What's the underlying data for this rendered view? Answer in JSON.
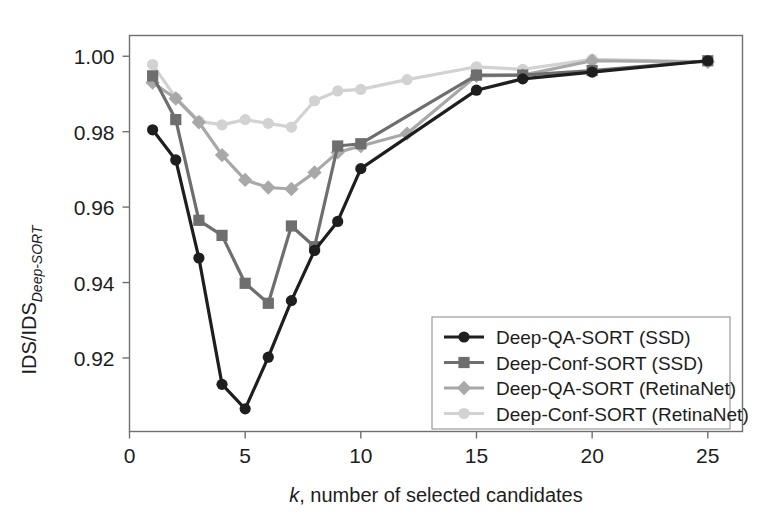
{
  "figure": {
    "background_color": "#ffffff",
    "frame_color": "#6f6f6f"
  },
  "chart_data": {
    "type": "line",
    "title": "",
    "xlabel": "k, number of selected candidates",
    "xlabel_italic_part": "k",
    "xlabel_rest": ", number of selected candidates",
    "ylabel": "IDS/IDS_Deep-SORT",
    "ylabel_main": "IDS/IDS",
    "ylabel_sub": "Deep-SORT",
    "xlim": [
      0,
      26.5
    ],
    "ylim": [
      0.9005,
      1.0055
    ],
    "xticks": [
      0,
      5,
      10,
      15,
      20,
      25
    ],
    "xtick_labels": [
      "0",
      "5",
      "10",
      "15",
      "20",
      "25"
    ],
    "yticks": [
      0.92,
      0.94,
      0.96,
      0.98,
      1.0
    ],
    "ytick_labels": [
      "0.92",
      "0.94",
      "0.96",
      "0.98",
      "1.00"
    ],
    "grid": false,
    "legend_position": "lower-right-inside",
    "series": [
      {
        "name": "Deep-QA-SORT (SSD)",
        "color": "#1e1e1e",
        "marker": "circle",
        "x": [
          1,
          2,
          3,
          4,
          5,
          6,
          7,
          8,
          9,
          10,
          15,
          17,
          20,
          25
        ],
        "y": [
          0.9805,
          0.9725,
          0.9465,
          0.913,
          0.9065,
          0.9202,
          0.9352,
          0.9485,
          0.9562,
          0.9702,
          0.991,
          0.994,
          0.9958,
          0.9988
        ]
      },
      {
        "name": "Deep-Conf-SORT (SSD)",
        "color": "#6e6e6e",
        "marker": "square",
        "x": [
          1,
          2,
          3,
          4,
          5,
          6,
          7,
          8,
          9,
          10,
          15,
          17,
          20,
          25
        ],
        "y": [
          0.9948,
          0.9832,
          0.9565,
          0.9525,
          0.9398,
          0.9345,
          0.955,
          0.9495,
          0.9762,
          0.9768,
          0.995,
          0.995,
          0.9962,
          0.9988
        ]
      },
      {
        "name": "Deep-QA-SORT (RetinaNet)",
        "color": "#a8a8a8",
        "marker": "diamond",
        "x": [
          1,
          2,
          3,
          4,
          5,
          6,
          7,
          8,
          9,
          10,
          12,
          15,
          17,
          20,
          25
        ],
        "y": [
          0.993,
          0.9888,
          0.9825,
          0.9738,
          0.9672,
          0.9652,
          0.9648,
          0.9692,
          0.9745,
          0.9762,
          0.9795,
          0.9948,
          0.995,
          0.9988,
          0.9985
        ]
      },
      {
        "name": "Deep-Conf-SORT (RetinaNet)",
        "color": "#d2d2d2",
        "marker": "circle",
        "x": [
          1,
          2,
          3,
          4,
          5,
          6,
          7,
          8,
          9,
          10,
          12,
          15,
          17,
          20,
          25
        ],
        "y": [
          0.9978,
          0.989,
          0.9828,
          0.9818,
          0.9832,
          0.9822,
          0.9812,
          0.9882,
          0.9908,
          0.9912,
          0.9938,
          0.9972,
          0.9965,
          0.9992,
          0.9985
        ]
      }
    ]
  },
  "legend": {
    "entries": [
      {
        "label": "Deep-QA-SORT (SSD)",
        "color": "#1e1e1e",
        "marker": "circle"
      },
      {
        "label": "Deep-Conf-SORT (SSD)",
        "color": "#6e6e6e",
        "marker": "square"
      },
      {
        "label": "Deep-QA-SORT (RetinaNet)",
        "color": "#a8a8a8",
        "marker": "diamond"
      },
      {
        "label": "Deep-Conf-SORT (RetinaNet)",
        "color": "#d2d2d2",
        "marker": "circle"
      }
    ]
  }
}
